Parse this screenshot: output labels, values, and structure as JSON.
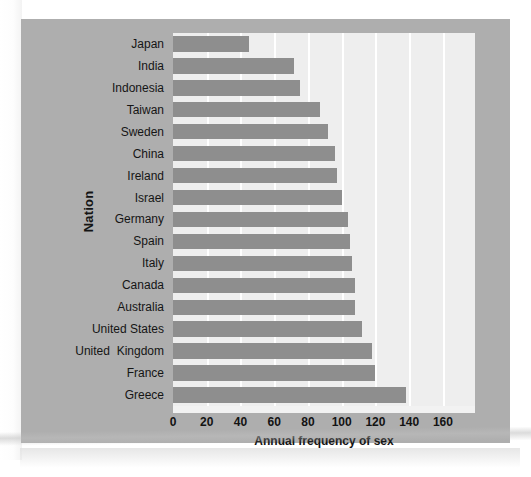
{
  "figure": {
    "background_color": "#aeaeae",
    "plot_background_color": "#eeeeee",
    "bar_color": "#8e8e8e",
    "gridline_color": "#ffffff"
  },
  "chart_data": {
    "type": "bar",
    "orientation": "horizontal",
    "title": "",
    "xlabel": "Annual frequency of sex",
    "ylabel": "Nation",
    "categories": [
      "Japan",
      "India",
      "Indonesia",
      "Taiwan",
      "Sweden",
      "China",
      "Ireland",
      "Israel",
      "Germany",
      "Spain",
      "Italy",
      "Canada",
      "Australia",
      "United States",
      "United  Kingdom",
      "France",
      "Greece"
    ],
    "values": [
      45,
      72,
      75,
      87,
      92,
      96,
      97,
      100,
      104,
      105,
      106,
      108,
      108,
      112,
      118,
      120,
      138
    ],
    "xlim": [
      0,
      179
    ],
    "ylim": [
      0,
      17
    ],
    "xticks": [
      0,
      20,
      40,
      60,
      80,
      100,
      120,
      140,
      160
    ],
    "xtick_labels": [
      "0",
      "20",
      "40",
      "60",
      "80",
      "100",
      "120",
      "140",
      "160"
    ],
    "grid": true,
    "grid_axis": "x",
    "legend": null,
    "legend_position": "none"
  }
}
